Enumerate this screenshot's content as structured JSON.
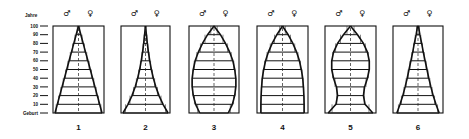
{
  "figure": {
    "y_axis_label": "Jahre",
    "male_symbol": "♂",
    "female_symbol": "♀",
    "y_ticks": [
      "100",
      "90",
      "80",
      "70",
      "60",
      "50",
      "40",
      "30",
      "20",
      "10",
      "Geburt"
    ],
    "panel_numbers": [
      "1",
      "2",
      "3",
      "4",
      "5",
      "6"
    ]
  },
  "chart_data": {
    "type": "population-pyramids",
    "ylabel": "Jahre",
    "y_ticks": [
      "Geburt",
      "10",
      "20",
      "30",
      "40",
      "50",
      "60",
      "70",
      "80",
      "90",
      "100"
    ],
    "ylim": [
      0,
      100
    ],
    "legend": {
      "left": "♂ (male)",
      "right": "♀ (female)"
    },
    "panels": [
      {
        "label": "1",
        "shape": "triangle (linear)",
        "ages": [
          0,
          10,
          20,
          30,
          40,
          50,
          60,
          70,
          80,
          90,
          100
        ],
        "half_width_fraction": [
          1.0,
          0.9,
          0.8,
          0.7,
          0.6,
          0.5,
          0.4,
          0.3,
          0.2,
          0.1,
          0.0
        ]
      },
      {
        "label": "2",
        "shape": "concave pyramid",
        "ages": [
          0,
          10,
          20,
          30,
          40,
          50,
          60,
          70,
          80,
          90,
          100
        ],
        "half_width_fraction": [
          1.0,
          0.78,
          0.6,
          0.46,
          0.35,
          0.26,
          0.19,
          0.13,
          0.08,
          0.04,
          0.0
        ]
      },
      {
        "label": "3",
        "shape": "bell / ogive",
        "ages": [
          0,
          10,
          20,
          30,
          40,
          50,
          60,
          70,
          80,
          90,
          100
        ],
        "half_width_fraction": [
          0.62,
          0.8,
          0.9,
          0.95,
          0.95,
          0.9,
          0.82,
          0.68,
          0.5,
          0.28,
          0.0
        ]
      },
      {
        "label": "4",
        "shape": "bell (stationary)",
        "ages": [
          0,
          10,
          20,
          30,
          40,
          50,
          60,
          70,
          80,
          90,
          100
        ],
        "half_width_fraction": [
          0.92,
          0.92,
          0.91,
          0.89,
          0.86,
          0.8,
          0.72,
          0.6,
          0.44,
          0.24,
          0.0
        ]
      },
      {
        "label": "5",
        "shape": "urn (constricted base)",
        "ages": [
          0,
          10,
          20,
          30,
          40,
          50,
          60,
          70,
          80,
          90,
          100
        ],
        "half_width_fraction": [
          0.95,
          0.62,
          0.55,
          0.6,
          0.72,
          0.8,
          0.8,
          0.72,
          0.55,
          0.3,
          0.0
        ]
      },
      {
        "label": "6",
        "shape": "steep triangle",
        "ages": [
          0,
          10,
          20,
          30,
          40,
          50,
          60,
          70,
          80,
          90,
          100
        ],
        "half_width_fraction": [
          0.92,
          0.78,
          0.66,
          0.56,
          0.47,
          0.39,
          0.31,
          0.23,
          0.16,
          0.08,
          0.02
        ]
      }
    ]
  }
}
